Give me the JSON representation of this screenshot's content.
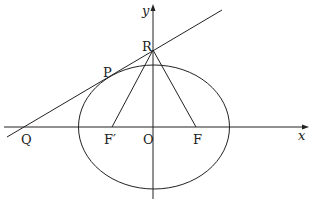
{
  "diagram": {
    "axes": {
      "x_label": "x",
      "y_label": "y",
      "origin_label": "O"
    },
    "points": {
      "P": "P",
      "Q": "Q",
      "R": "R",
      "F": "F",
      "F_prime": "F′"
    },
    "colors": {
      "stroke": "#222222",
      "background": "#ffffff"
    }
  }
}
